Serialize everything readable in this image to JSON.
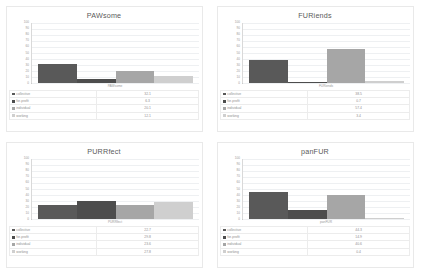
{
  "document": {
    "background_color": "#ffffff",
    "layout": "2x2-chart-grid"
  },
  "palette": {
    "series": [
      "#595959",
      "#4d4d4d",
      "#a6a6a6",
      "#cfcfcf"
    ],
    "gridline": "#eef0f2",
    "axis": "#bdbdbd",
    "text": "#8f8f8f",
    "title_text": "#5a5a5a"
  },
  "series_names": [
    "collective",
    "for-profit",
    "individual",
    "working"
  ],
  "axis": {
    "yticks": [
      "100",
      "90",
      "80",
      "70",
      "60",
      "50",
      "40",
      "30",
      "20",
      "10",
      "0"
    ],
    "ymin": 0,
    "ymax": 100,
    "grid": true,
    "legend_position": "bottom-table"
  },
  "chart_data": [
    {
      "type": "bar",
      "title": "PAWsome",
      "xlabel": "PAWsome",
      "ylabel": "",
      "categories": [
        "collective",
        "for-profit",
        "individual",
        "working"
      ],
      "values": [
        32.1,
        6.3,
        20.1,
        12.1
      ],
      "value_labels": [
        "32.1",
        "6.3",
        "20.1",
        "12.1"
      ],
      "ylim": [
        0,
        100
      ],
      "grid": true
    },
    {
      "type": "bar",
      "title": "FURiends",
      "xlabel": "FURiends",
      "ylabel": "",
      "categories": [
        "collective",
        "for-profit",
        "individual",
        "working"
      ],
      "values": [
        38.5,
        0.7,
        57.4,
        3.4
      ],
      "value_labels": [
        "38.5",
        "0.7",
        "57.4",
        "3.4"
      ],
      "ylim": [
        0,
        100
      ],
      "grid": true
    },
    {
      "type": "bar",
      "title": "PURRfect",
      "xlabel": "PURRfect",
      "ylabel": "",
      "categories": [
        "collective",
        "for-profit",
        "individual",
        "working"
      ],
      "values": [
        22.7,
        29.8,
        23.6,
        27.8
      ],
      "value_labels": [
        "22.7",
        "29.8",
        "23.6",
        "27.8"
      ],
      "ylim": [
        0,
        100
      ],
      "grid": true
    },
    {
      "type": "bar",
      "title": "panFUR",
      "xlabel": "panFUR",
      "ylabel": "",
      "categories": [
        "collective",
        "for-profit",
        "individual",
        "working"
      ],
      "values": [
        44.3,
        14.9,
        40.6,
        0.4
      ],
      "value_labels": [
        "44.3",
        "14.9",
        "40.6",
        "0.4"
      ],
      "ylim": [
        0,
        100
      ],
      "grid": true
    }
  ]
}
